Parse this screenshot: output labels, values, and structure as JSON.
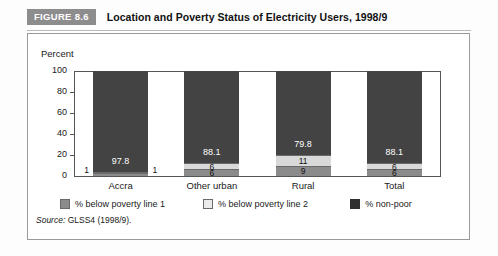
{
  "figure": {
    "badge": "FIGURE 8.6",
    "title": "Location and Poverty Status of Electricity Users, 1998/9",
    "source_prefix": "Source:",
    "source_text": "GLSS4 (1998/9)."
  },
  "legend": {
    "items": [
      {
        "label": "% below poverty line 1",
        "color": "#8b8b8b",
        "icon": "legend-swatch-icon"
      },
      {
        "label": "% below poverty line 2",
        "color": "#ebebeb",
        "icon": "legend-swatch-icon"
      },
      {
        "label": "% non-poor",
        "color": "#2f2f2f",
        "icon": "legend-swatch-icon"
      }
    ]
  },
  "axis": {
    "y_title": "Percent",
    "y_ticks": [
      "100",
      "80",
      "60",
      "40",
      "20",
      "0"
    ]
  },
  "chart_data": {
    "type": "bar",
    "subtype": "stacked-vertical",
    "title": "Location and Poverty Status of Electricity Users, 1998/9",
    "xlabel": "",
    "ylabel": "Percent",
    "ylim": [
      0,
      100
    ],
    "grid": false,
    "legend_position": "bottom",
    "categories": [
      "Accra",
      "Other urban",
      "Rural",
      "Total"
    ],
    "series": [
      {
        "name": "% below poverty line 1",
        "color": "#8b8b8b",
        "values": [
          1,
          6,
          9,
          6
        ]
      },
      {
        "name": "% below poverty line 2",
        "color": "#ebebeb",
        "values": [
          1,
          6,
          11,
          6
        ]
      },
      {
        "name": "% non-poor",
        "color": "#434343",
        "values": [
          97.8,
          88.1,
          79.8,
          88.1
        ]
      }
    ],
    "data_labels": {
      "non_poor": [
        "97.8",
        "88.1",
        "79.8",
        "88.1"
      ],
      "line2": [
        "1",
        "6",
        "11",
        "6"
      ],
      "line1": [
        "1",
        "6",
        "9",
        "6"
      ]
    }
  },
  "bars": [
    {
      "category": "Accra",
      "nonpoor": {
        "value": 97.8,
        "label": "97.8"
      },
      "line2": {
        "value": 1,
        "label": "1",
        "outside": "right"
      },
      "line1": {
        "value": 1,
        "label": "1",
        "outside": "left"
      }
    },
    {
      "category": "Other urban",
      "nonpoor": {
        "value": 88.1,
        "label": "88.1"
      },
      "line2": {
        "value": 6,
        "label": "6",
        "outside": "none"
      },
      "line1": {
        "value": 6,
        "label": "6",
        "outside": "none"
      }
    },
    {
      "category": "Rural",
      "nonpoor": {
        "value": 79.8,
        "label": "79.8"
      },
      "line2": {
        "value": 11,
        "label": "11",
        "outside": "none"
      },
      "line1": {
        "value": 9,
        "label": "9",
        "outside": "none"
      }
    },
    {
      "category": "Total",
      "nonpoor": {
        "value": 88.1,
        "label": "88.1"
      },
      "line2": {
        "value": 6,
        "label": "6",
        "outside": "none"
      },
      "line1": {
        "value": 6,
        "label": "6",
        "outside": "none"
      }
    }
  ]
}
